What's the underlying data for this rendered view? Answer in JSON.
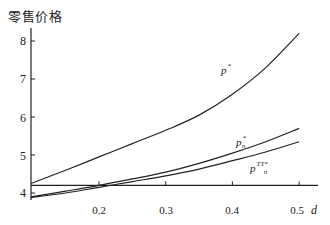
{
  "chart_data": {
    "type": "line",
    "title": "",
    "ylabel": "零售价格",
    "xlabel": "d",
    "xlim": [
      0.1,
      0.5
    ],
    "ylim": [
      3.8,
      8.4
    ],
    "x_ticks": [
      "0.2",
      "0.3",
      "0.4",
      "0.5"
    ],
    "y_ticks": [
      "4",
      "5",
      "6",
      "7",
      "8"
    ],
    "grid": false,
    "legend": "inline labels",
    "x": [
      0.1,
      0.15,
      0.2,
      0.25,
      0.3,
      0.35,
      0.4,
      0.45,
      0.5
    ],
    "series": [
      {
        "name": "p*",
        "label_base": "p",
        "label_sup": "*",
        "label_sub": "",
        "values": [
          4.25,
          4.6,
          4.95,
          5.3,
          5.65,
          6.05,
          6.6,
          7.3,
          8.2
        ]
      },
      {
        "name": "p*_n",
        "label_base": "p",
        "label_sup": "*",
        "label_sub": "n",
        "values": [
          3.9,
          4.05,
          4.2,
          4.37,
          4.55,
          4.78,
          5.05,
          5.35,
          5.7
        ]
      },
      {
        "name": "p^{TT*}_n",
        "label_base": "p",
        "label_sup": "TT*",
        "label_sub": "n",
        "values": [
          3.88,
          4.0,
          4.15,
          4.3,
          4.45,
          4.63,
          4.85,
          5.08,
          5.35
        ]
      },
      {
        "name": "baseline",
        "label_base": "",
        "label_sup": "",
        "label_sub": "",
        "values": [
          4.2,
          4.2,
          4.2,
          4.2,
          4.2,
          4.2,
          4.2,
          4.2,
          4.2
        ]
      }
    ]
  },
  "labels": {
    "y_title": "零售价格",
    "x_title": "d",
    "y_ticks": [
      "8",
      "7",
      "6",
      "5",
      "4"
    ],
    "x_ticks": [
      "0.2",
      "0.3",
      "0.4",
      "0.5"
    ]
  }
}
